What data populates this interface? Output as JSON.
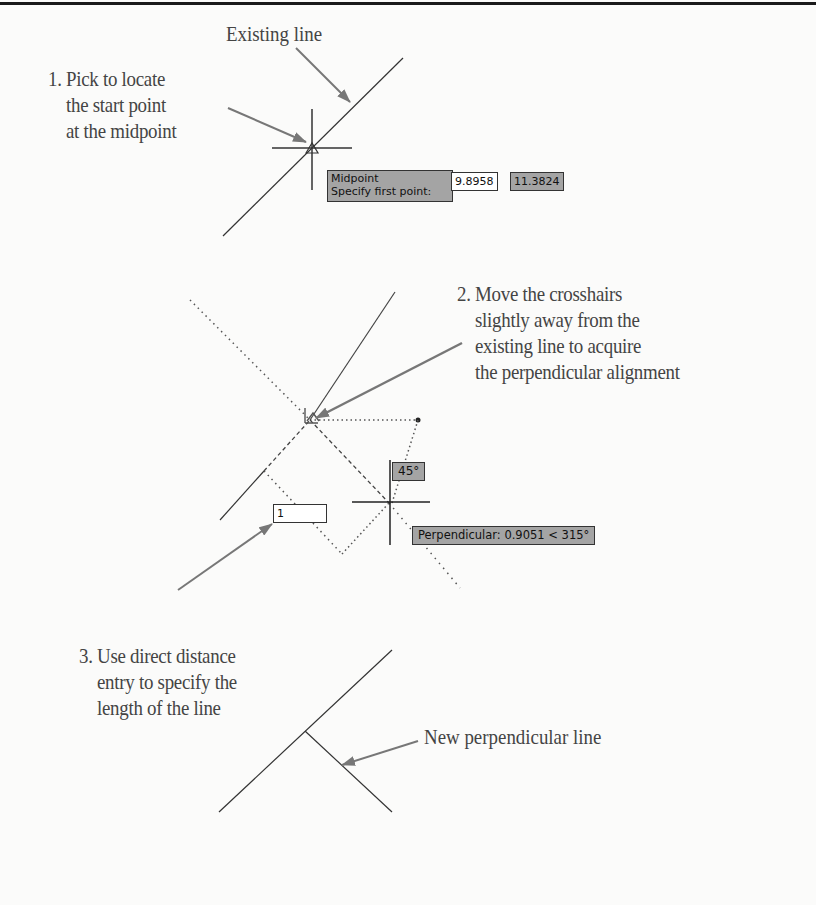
{
  "figure": {
    "labels": {
      "existing_line": "Existing line",
      "new_perpendicular_line": "New perpendicular line"
    },
    "steps": [
      {
        "number": "1.",
        "lines": [
          "Pick to locate",
          "the start point",
          "at the midpoint"
        ]
      },
      {
        "number": "2.",
        "lines": [
          "Move the crosshairs",
          "slightly away from the",
          "existing line to acquire",
          "the perpendicular alignment"
        ]
      },
      {
        "number": "3.",
        "lines": [
          "Use direct distance",
          "entry to specify the",
          "length of the line"
        ]
      }
    ],
    "snap_tooltip": {
      "line1": "Midpoint",
      "line2": "Specify first point:",
      "x_value": "9.8958",
      "y_value": "11.3824"
    },
    "polar_tooltip": {
      "angle": "45°",
      "perpendicular": "Perpendicular: 0.9051 < 315°",
      "distance_input": "1"
    },
    "colors": {
      "tooltip_bg": "#a4a4a4",
      "line": "#333333",
      "arrow": "#777777"
    }
  }
}
